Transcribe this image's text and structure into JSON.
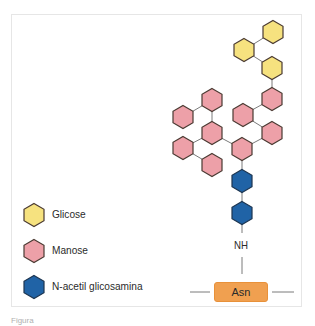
{
  "figure": {
    "legend": [
      {
        "label": "Glicose",
        "color": "#f6e27f",
        "icon": "yellow-hexagon"
      },
      {
        "label": "Manose",
        "color": "#eda0a8",
        "icon": "pink-hexagon"
      },
      {
        "label": "N-acetil glicosamina",
        "color": "#2063a6",
        "icon": "blue-hexagon"
      }
    ],
    "linker_label": "NH",
    "residue_label": "Asn",
    "caption": "Figura"
  },
  "colors": {
    "glucose_fill": "#f6e27f",
    "mannose_fill": "#eda0a8",
    "glcnac_fill": "#2063a6",
    "hex_stroke": "#4a3a32",
    "asn_fill": "#f0a050",
    "line": "#777777"
  }
}
